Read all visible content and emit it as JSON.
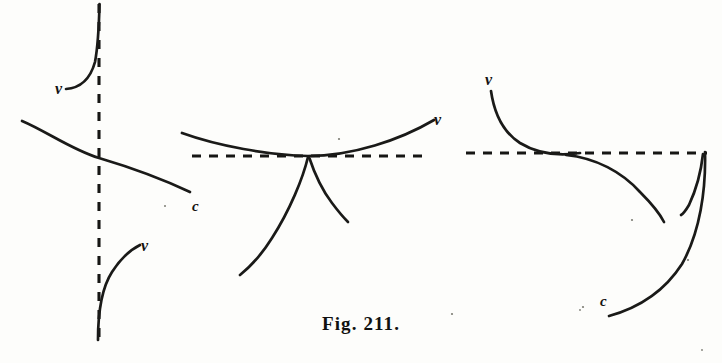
{
  "figure": {
    "caption": "Fig. 211.",
    "medium": "scanned-engraving",
    "background_color": "#fdfdfb",
    "ink_color": "#1a1a18",
    "panel_count": 3,
    "panels": [
      {
        "id": "left-panel",
        "name": "vertical-asymptote-panel",
        "asymptote": {
          "orientation": "vertical",
          "style": "dashed",
          "x": 99,
          "y_start": 4,
          "y_end": 346
        },
        "labels": [
          {
            "text": "v",
            "x": 60,
            "y": 90
          },
          {
            "text": "c",
            "x": 196,
            "y": 206
          },
          {
            "text": "v",
            "x": 146,
            "y": 246
          }
        ],
        "branch_count": 3
      },
      {
        "id": "middle-panel",
        "name": "cusp-on-horizontal-asymptote-panel",
        "asymptote": {
          "orientation": "horizontal",
          "style": "dashed",
          "y": 156,
          "x_start": 192,
          "x_end": 430
        },
        "cusp_point": {
          "x": 308,
          "y": 156
        },
        "labels": [
          {
            "text": "v",
            "x": 438,
            "y": 124
          }
        ],
        "branch_count": 3
      },
      {
        "id": "right-panel",
        "name": "horizontal-asymptote-corner-panel",
        "asymptote": {
          "orientation": "horizontal",
          "style": "dashed",
          "y": 153,
          "x_start": 466,
          "x_end": 707
        },
        "labels": [
          {
            "text": "v",
            "x": 487,
            "y": 86
          },
          {
            "text": "c",
            "x": 604,
            "y": 302
          }
        ],
        "branch_count": 3
      }
    ]
  }
}
